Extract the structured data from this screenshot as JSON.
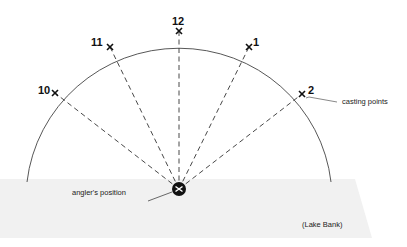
{
  "diagram": {
    "title": "",
    "colors": {
      "background": "#ffffff",
      "bank": "#f1f1f1",
      "line": "#333333",
      "angler": "#111111"
    },
    "angler": {
      "label": "angler's position",
      "x": 179,
      "y": 189
    },
    "casting_points_label": "casting points",
    "bank_label": "(Lake Bank)",
    "points": [
      {
        "label": "10",
        "x": 55,
        "y": 93,
        "lx": 38,
        "ly": 85
      },
      {
        "label": "11",
        "x": 110,
        "y": 47,
        "lx": 93,
        "ly": 38
      },
      {
        "label": "12",
        "x": 179,
        "y": 31,
        "lx": 173,
        "ly": 17
      },
      {
        "label": "1",
        "x": 249,
        "y": 47,
        "lx": 254,
        "ly": 37
      },
      {
        "label": "2",
        "x": 302,
        "y": 94,
        "lx": 307,
        "ly": 85
      }
    ]
  }
}
